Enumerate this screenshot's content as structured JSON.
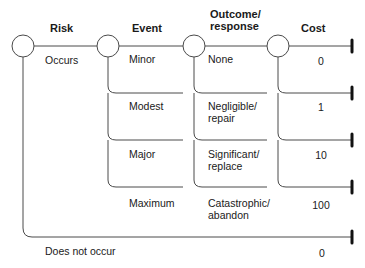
{
  "diagram": {
    "type": "decision-tree",
    "headers": {
      "risk": "Risk",
      "event": "Event",
      "outcome": "Outcome/\nresponse",
      "cost": "Cost"
    },
    "risk_branches": {
      "occurs": "Occurs",
      "does_not_occur": "Does not occur",
      "does_not_occur_cost": "0"
    },
    "rows": [
      {
        "event": "Minor",
        "outcome": "None",
        "cost": "0"
      },
      {
        "event": "Modest",
        "outcome": "Negligible/\nrepair",
        "cost": "1"
      },
      {
        "event": "Major",
        "outcome": "Significant/\nreplace",
        "cost": "10"
      },
      {
        "event": "Maximum",
        "outcome": "Catastrophic/\nabandon",
        "cost": "100"
      }
    ],
    "colors": {
      "line": "#4a4a4a",
      "terminal": "#111111",
      "text": "#1a1a1a"
    }
  }
}
